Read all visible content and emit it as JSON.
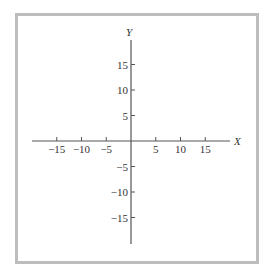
{
  "chart_data": {
    "type": "line",
    "title": "",
    "xlabel": "X",
    "ylabel": "Y",
    "xlim": [
      -20,
      20
    ],
    "ylim": [
      -20,
      20
    ],
    "grid": false,
    "x_ticks": [
      -15,
      -10,
      -5,
      5,
      10,
      15
    ],
    "y_ticks": [
      15,
      10,
      5,
      -5,
      -10,
      -15
    ],
    "x_tick_labels": [
      "−15",
      "−10",
      "−5",
      "5",
      "10",
      "15"
    ],
    "y_tick_labels": [
      "15",
      "10",
      "5",
      "−5",
      "−10",
      "−15"
    ],
    "series": []
  },
  "labels": {
    "x_axis": "X",
    "y_axis": "Y"
  },
  "colors": {
    "axis": "#555555",
    "border": "#bdbdbd",
    "text": "#333333"
  }
}
